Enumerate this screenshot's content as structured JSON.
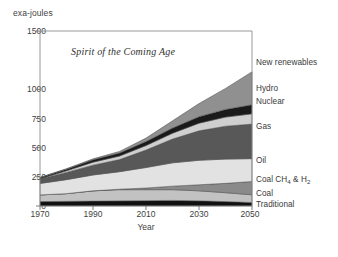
{
  "chart_data": {
    "type": "area",
    "stacked": true,
    "title": "Spirit of the Coming Age",
    "xlabel": "Year",
    "ylabel": "exa-joules",
    "xlim": [
      1970,
      2050
    ],
    "ylim": [
      0,
      1500
    ],
    "xticks": [
      1970,
      1990,
      2010,
      2030,
      2050
    ],
    "yticks": [
      0,
      250,
      500,
      750,
      1000,
      1500
    ],
    "ytick_labels": [
      "0",
      "250",
      "500",
      "750",
      "1000",
      "1500"
    ],
    "grid": false,
    "legend_position": "right-inline-labels",
    "x": [
      1970,
      1980,
      1990,
      2000,
      2010,
      2020,
      2030,
      2040,
      2050
    ],
    "series": [
      {
        "name": "Traditional",
        "color": "#111111",
        "values": [
          38,
          40,
          42,
          44,
          46,
          48,
          44,
          38,
          30
        ]
      },
      {
        "name": "Coal",
        "color": "#c2c2c2",
        "values": [
          57,
          66,
          88,
          96,
          94,
          92,
          86,
          76,
          66
        ]
      },
      {
        "name": "Coal CH4 & H2",
        "color": "#8a8a8a",
        "values": [
          0,
          0,
          0,
          4,
          14,
          30,
          52,
          80,
          114
        ]
      },
      {
        "name": "Oil",
        "color": "#e2e2e2",
        "values": [
          98,
          120,
          136,
          150,
          176,
          200,
          210,
          208,
          196
        ]
      },
      {
        "name": "Gas",
        "color": "#585858",
        "values": [
          38,
          62,
          84,
          104,
          150,
          204,
          252,
          282,
          296
        ]
      },
      {
        "name": "Nuclear",
        "color": "#cfcfcf",
        "values": [
          2,
          14,
          26,
          30,
          38,
          50,
          66,
          78,
          88
        ]
      },
      {
        "name": "Hydro",
        "color": "#1a1a1a",
        "values": [
          10,
          14,
          20,
          26,
          34,
          44,
          56,
          66,
          78
        ]
      },
      {
        "name": "New renewables",
        "color": "#909090",
        "values": [
          2,
          4,
          8,
          14,
          30,
          62,
          112,
          180,
          282
        ]
      }
    ],
    "series_labels": [
      {
        "name": "New renewables",
        "display": "New renewables",
        "y_position": 1105
      },
      {
        "name": "Hydro",
        "display": "Hydro",
        "y_position": 880
      },
      {
        "name": "Nuclear",
        "display": "Nuclear",
        "y_position": 812
      },
      {
        "name": "Gas",
        "display": "Gas",
        "y_position": 655
      },
      {
        "name": "Oil",
        "display": "Oil",
        "y_position": 430
      },
      {
        "name": "Coal CH4 & H2",
        "display": "Coal CH",
        "display_sub1": "4",
        "display_tail": " & H",
        "display_sub2": "2",
        "y_position": 285
      },
      {
        "name": "Coal",
        "display": "Coal",
        "y_position": 150
      },
      {
        "name": "Traditional",
        "display": "Traditional",
        "y_position": 65
      }
    ],
    "totals": [
      245,
      320,
      404,
      468,
      582,
      730,
      878,
      1008,
      1150
    ]
  }
}
